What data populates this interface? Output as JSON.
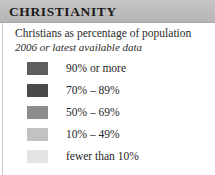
{
  "card": {
    "title": "CHRISTIANITY",
    "title_bar_color": "#bdbdbd",
    "background_color": "#ffffff"
  },
  "subtitle": {
    "primary": "Christians as percentage of population",
    "secondary": "2006 or latest available data"
  },
  "legend": {
    "items": [
      {
        "label": "90% or more",
        "color": "#5e5e5e"
      },
      {
        "label": "70% – 89%",
        "color": "#4a4a4a"
      },
      {
        "label": "50% – 69%",
        "color": "#8c8c8c"
      },
      {
        "label": "10% – 49%",
        "color": "#c2c2c2"
      },
      {
        "label": "fewer than 10%",
        "color": "#e4e4e4"
      }
    ]
  }
}
